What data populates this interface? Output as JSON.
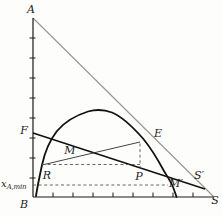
{
  "figure_labels": {
    "vertex_top": "A",
    "vertex_origin": "B",
    "vertex_right": "S",
    "solvent_prime": "S′",
    "feed": "F",
    "mixture": "M",
    "raffinate": "R",
    "extract": "E",
    "pole": "P",
    "m_prime": "M′",
    "x_min_symbol": "x",
    "x_min_subscript": "A,min"
  },
  "colors": {
    "axis": "#1a1a1a",
    "binodal": "#111111",
    "operating_line": "#111111",
    "tie_line": "#2e2e2e",
    "dashed": "#555555",
    "hypotenuse": "#979590",
    "background": "#fdfdfc",
    "text": "#1c1c1c"
  }
}
